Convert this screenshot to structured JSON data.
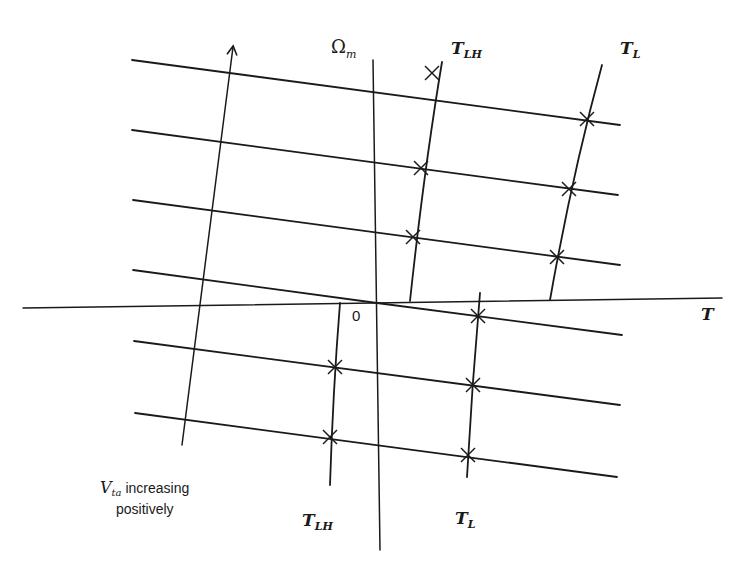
{
  "diagram": {
    "axes": {
      "vertical": {
        "symbol": "Ω",
        "subscript": "m"
      },
      "horizontal": {
        "symbol": "T"
      },
      "origin": "0"
    },
    "curves": {
      "upper_lh": {
        "symbol": "T",
        "subscript": "LH"
      },
      "upper_l": {
        "symbol": "T",
        "subscript": "L"
      },
      "lower_lh": {
        "symbol": "T",
        "subscript": "LH"
      },
      "lower_l": {
        "symbol": "T",
        "subscript": "L"
      }
    },
    "annotation": {
      "symbol": "V",
      "subscript": "ta",
      "line1": " increasing",
      "line2": "positively"
    },
    "colors": {
      "stroke": "#1a1a1a",
      "background": "#ffffff"
    },
    "parallel_line_count": 7,
    "intersection_marker": "x-cross",
    "intersection_count": 11
  }
}
